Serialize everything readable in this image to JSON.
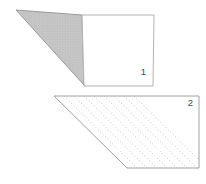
{
  "diagram": {
    "background_color": "#ffffff",
    "label_color": "#4a4a4a",
    "pieces": [
      {
        "label": "1",
        "square": {
          "points": [
            [
              82,
              15
            ],
            [
              154,
              15
            ],
            [
              153,
              86
            ],
            [
              84,
              86
            ]
          ],
          "fill": "#ffffff",
          "stroke": "#b3b3b3"
        },
        "shaded_triangle": {
          "points": [
            [
              16,
              10
            ],
            [
              82,
              15
            ],
            [
              84,
              85
            ]
          ],
          "fill": "#cacaca",
          "dot_color": "#a0a0a0",
          "stroke": "#9a9a9a"
        },
        "label_position": [
          143.5,
          75
        ]
      },
      {
        "label": "2",
        "outline": {
          "points": [
            [
              54,
              96
            ],
            [
              199,
              96
            ],
            [
              199,
              168
            ],
            [
              127,
              168
            ],
            [
              121,
              162
            ]
          ],
          "fill": "#ffffff",
          "stroke": "#a0a0a0"
        },
        "fold_lines": {
          "count": 8,
          "start_x": 64,
          "spacing": 10,
          "top_y": 96,
          "bottom_y": 168,
          "run": 73,
          "stroke": "#aeaeae",
          "dash": "1 2.4",
          "width": 0.8
        },
        "label_position": [
          190.5,
          106
        ]
      }
    ]
  }
}
